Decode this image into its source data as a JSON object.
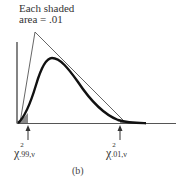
{
  "caption": {
    "line1": "Each shaded",
    "line2": "area = .01"
  },
  "labels": {
    "left": {
      "symbol": "χ",
      "sup": "2",
      "sub": ".99,ν"
    },
    "right": {
      "symbol": "χ",
      "sup": "2",
      "sub": ".01,ν"
    }
  },
  "panel_label": "(b)",
  "colors": {
    "curve": "#111111",
    "lines": "#444444",
    "shade": "#888888"
  }
}
